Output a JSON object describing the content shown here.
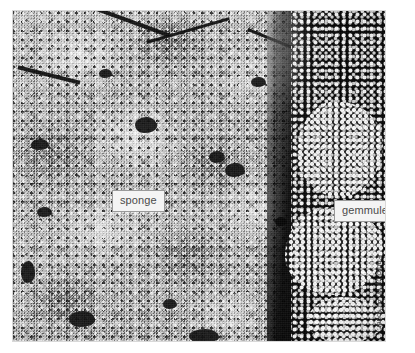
{
  "figure": {
    "type": "photograph",
    "color_mode": "grayscale"
  },
  "photo": {
    "description": "Black-and-white close-up photograph of an encrusting sponge. The left and center of the frame show a pale, granular, cauliflower-textured sponge mass pitted with dark oscula and crossed by dark diagonal fissures near the top. The right edge is a dark field occupied by dense clusters of small bright spherical gemmules.",
    "regions": {
      "sponge": "pale granular mass filling the left and central portion of the frame",
      "gemmules": "dense bright spherical bodies against black substrate along the right margin"
    }
  },
  "callouts": [
    {
      "id": "sponge",
      "label": "sponge",
      "points_to": "pale granular sponge mass, center-left of frame"
    },
    {
      "id": "gemmules",
      "label": "gemmules",
      "points_to": "cluster of small spheres along the right margin"
    }
  ],
  "credit": {
    "text": "Photo by W. A. Yoder.",
    "orientation": "vertical",
    "position": "right margin, outside photo"
  },
  "colors": {
    "page_background": "#ffffff",
    "callout_background": "#f4f4f4",
    "callout_border": "#9a9a9a",
    "callout_text": "#4a4a4a",
    "credit_text": "#3c3c3c",
    "sponge_light": "#e8e8e8",
    "sponge_mid": "#a8a8a8",
    "sponge_dark": "#2a2a2a",
    "gemmule_field": "#050505",
    "gemmule_highlight": "#fcfcfc"
  }
}
